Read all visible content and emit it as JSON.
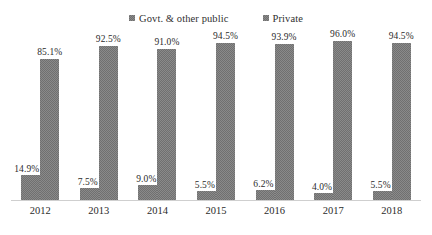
{
  "chart_data": {
    "type": "bar",
    "title": "",
    "subtitle": "",
    "xlabel": "",
    "ylabel": "",
    "ylim": [
      0,
      100
    ],
    "grid": false,
    "legend_position": "top-center",
    "value_suffix": "%",
    "categories": [
      "2012",
      "2013",
      "2014",
      "2015",
      "2016",
      "2017",
      "2018"
    ],
    "series": [
      {
        "name": "Govt. & other public",
        "color": "#8a8a8a",
        "values": [
          14.9,
          7.5,
          9.0,
          5.5,
          6.2,
          4.0,
          5.5
        ],
        "labels": [
          "14.9%",
          "7.5%",
          "9.0%",
          "5.5%",
          "6.2%",
          "4.0%",
          "5.5%"
        ]
      },
      {
        "name": "Private",
        "color": "#8a8a8a",
        "values": [
          85.1,
          92.5,
          91.0,
          94.5,
          93.9,
          96.0,
          94.5
        ],
        "labels": [
          "85.1%",
          "92.5%",
          "91.0%",
          "94.5%",
          "93.9%",
          "96.0%",
          "94.5%"
        ]
      }
    ]
  },
  "legend": {
    "entries": [
      {
        "label": "Govt. & other public",
        "marker": "square-marker"
      },
      {
        "label": "Private",
        "marker": "square-marker"
      }
    ]
  }
}
